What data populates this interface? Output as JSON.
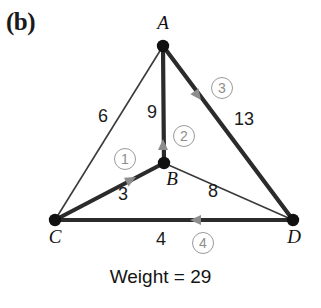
{
  "figure": {
    "panel_label": "(b)",
    "total_weight_text": "Weight = 29",
    "colors": {
      "edge_tree": "#2b2b2b",
      "edge_plain": "#3a3a3a",
      "node": "#111111",
      "arrow": "#8d8d8d",
      "step_circle": "#9a9a9a",
      "background": "#ffffff"
    }
  },
  "graph": {
    "type": "weighted-undirected-graph-spanning-tree",
    "vertices": [
      {
        "id": "A",
        "label": "A",
        "x": 163,
        "y": 46
      },
      {
        "id": "B",
        "label": "B",
        "x": 164,
        "y": 163
      },
      {
        "id": "C",
        "label": "C",
        "x": 55,
        "y": 220
      },
      {
        "id": "D",
        "label": "D",
        "x": 293,
        "y": 220
      }
    ],
    "edges": [
      {
        "from": "C",
        "to": "A",
        "weight": "6",
        "in_tree": false,
        "step": null
      },
      {
        "from": "B",
        "to": "A",
        "weight": "9",
        "in_tree": true,
        "step": "2"
      },
      {
        "from": "A",
        "to": "D",
        "weight": "13",
        "in_tree": true,
        "step": "3"
      },
      {
        "from": "C",
        "to": "B",
        "weight": "3",
        "in_tree": true,
        "step": "1"
      },
      {
        "from": "B",
        "to": "D",
        "weight": "8",
        "in_tree": false,
        "step": null
      },
      {
        "from": "D",
        "to": "C",
        "weight": "4",
        "in_tree": true,
        "step": "4"
      }
    ],
    "weight_labels": [
      {
        "text": "6",
        "x": 88,
        "y": 106
      },
      {
        "text": "9",
        "x": 137,
        "y": 102
      },
      {
        "text": "13",
        "x": 225,
        "y": 109
      },
      {
        "text": "3",
        "x": 108,
        "y": 184
      },
      {
        "text": "8",
        "x": 198,
        "y": 181
      },
      {
        "text": "4",
        "x": 146,
        "y": 229
      }
    ],
    "steps": [
      {
        "number": "1",
        "text": "①",
        "x": 114,
        "y": 148
      },
      {
        "number": "2",
        "text": "②",
        "x": 173,
        "y": 125
      },
      {
        "number": "3",
        "text": "③",
        "x": 211,
        "y": 77
      },
      {
        "number": "4",
        "text": "④",
        "x": 192,
        "y": 232
      }
    ],
    "vertex_labels": [
      {
        "text": "A",
        "x": 150,
        "y": 12
      },
      {
        "text": "B",
        "x": 159,
        "y": 168
      },
      {
        "text": "C",
        "x": 42,
        "y": 226
      },
      {
        "text": "D",
        "x": 281,
        "y": 226
      }
    ]
  }
}
